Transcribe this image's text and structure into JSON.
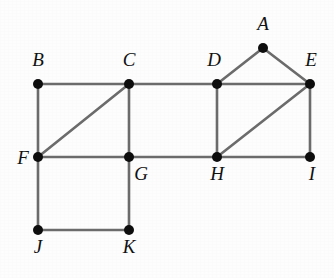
{
  "figure": {
    "kind": "undirected-graph-diagram",
    "background_color": "#fdfdfd",
    "edge_color": "#6b6b6b",
    "node_color": "#0d0d0d",
    "label_color": "#111111",
    "node_radius": 5.0,
    "edge_width": 2.6,
    "label_font_size": 19,
    "label_style": "italic-serif",
    "width": 334,
    "height": 278
  },
  "graph": {
    "node_count": 11,
    "edge_count": 17,
    "nodes": [
      {
        "id": "A",
        "label": "A",
        "x": 263,
        "y": 48,
        "label_x": 263,
        "label_y": 30,
        "label_anchor": "middle"
      },
      {
        "id": "B",
        "label": "B",
        "x": 38,
        "y": 84,
        "label_x": 38,
        "label_y": 66,
        "label_anchor": "middle"
      },
      {
        "id": "C",
        "label": "C",
        "x": 129,
        "y": 84,
        "label_x": 129,
        "label_y": 66,
        "label_anchor": "middle"
      },
      {
        "id": "D",
        "label": "D",
        "x": 217,
        "y": 84,
        "label_x": 214,
        "label_y": 66,
        "label_anchor": "middle"
      },
      {
        "id": "E",
        "label": "E",
        "x": 310,
        "y": 84,
        "label_x": 311,
        "label_y": 66,
        "label_anchor": "middle"
      },
      {
        "id": "F",
        "label": "F",
        "x": 38,
        "y": 157,
        "label_x": 23,
        "label_y": 164,
        "label_anchor": "middle"
      },
      {
        "id": "G",
        "label": "G",
        "x": 129,
        "y": 157,
        "label_x": 141,
        "label_y": 180,
        "label_anchor": "middle"
      },
      {
        "id": "H",
        "label": "H",
        "x": 217,
        "y": 157,
        "label_x": 217,
        "label_y": 180,
        "label_anchor": "middle"
      },
      {
        "id": "I",
        "label": "I",
        "x": 310,
        "y": 157,
        "label_x": 312,
        "label_y": 180,
        "label_anchor": "middle"
      },
      {
        "id": "J",
        "label": "J",
        "x": 38,
        "y": 230,
        "label_x": 38,
        "label_y": 253,
        "label_anchor": "middle"
      },
      {
        "id": "K",
        "label": "K",
        "x": 129,
        "y": 230,
        "label_x": 129,
        "label_y": 253,
        "label_anchor": "middle"
      }
    ],
    "edges": [
      {
        "from": "A",
        "to": "D"
      },
      {
        "from": "A",
        "to": "E"
      },
      {
        "from": "B",
        "to": "C"
      },
      {
        "from": "C",
        "to": "D"
      },
      {
        "from": "D",
        "to": "E"
      },
      {
        "from": "B",
        "to": "F"
      },
      {
        "from": "F",
        "to": "C"
      },
      {
        "from": "C",
        "to": "G"
      },
      {
        "from": "D",
        "to": "H"
      },
      {
        "from": "H",
        "to": "E"
      },
      {
        "from": "E",
        "to": "I"
      },
      {
        "from": "F",
        "to": "G"
      },
      {
        "from": "G",
        "to": "H"
      },
      {
        "from": "H",
        "to": "I"
      },
      {
        "from": "F",
        "to": "J"
      },
      {
        "from": "G",
        "to": "K"
      },
      {
        "from": "J",
        "to": "K"
      }
    ]
  }
}
